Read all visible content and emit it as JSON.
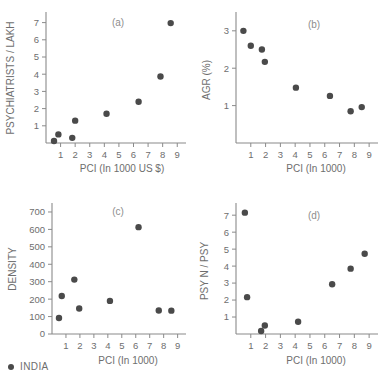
{
  "figure": {
    "marker_color": "#4a4a4a",
    "axis_color": "#8a8a8a",
    "text_color": "#6e6e6e",
    "background": "#ffffff"
  },
  "legend": {
    "label": "INDIA",
    "marker": "filled-circle"
  },
  "chart_data": [
    {
      "type": "scatter",
      "title": "(a)",
      "xlabel": "PCI (In 1000 US $)",
      "ylabel": "PSYCHIATRISTS / LAKH",
      "xlim": [
        0,
        9.6
      ],
      "ylim": [
        0,
        7.5
      ],
      "xticks": [
        1,
        2,
        3,
        4,
        5,
        6,
        7,
        8,
        9
      ],
      "yticks": [
        1,
        2,
        3,
        4,
        5,
        6,
        7
      ],
      "grid": false,
      "series": [
        {
          "name": "INDIA",
          "points": [
            {
              "x": 0.55,
              "y": 0.12
            },
            {
              "x": 0.85,
              "y": 0.5
            },
            {
              "x": 1.8,
              "y": 0.3
            },
            {
              "x": 2.0,
              "y": 1.3
            },
            {
              "x": 4.15,
              "y": 1.7
            },
            {
              "x": 6.35,
              "y": 2.4
            },
            {
              "x": 7.85,
              "y": 3.87
            },
            {
              "x": 8.55,
              "y": 6.97
            }
          ]
        }
      ]
    },
    {
      "type": "scatter",
      "title": "(b)",
      "xlabel": "PCI (In 1000)",
      "ylabel": "AGR (%)",
      "xlim": [
        0,
        9.6
      ],
      "ylim": [
        0,
        3.45
      ],
      "xticks": [
        1,
        2,
        3,
        4,
        5,
        6,
        7,
        8,
        9
      ],
      "yticks": [
        1,
        2,
        3
      ],
      "grid": false,
      "series": [
        {
          "name": "INDIA",
          "points": [
            {
              "x": 0.5,
              "y": 3.0
            },
            {
              "x": 1.0,
              "y": 2.6
            },
            {
              "x": 1.75,
              "y": 2.5
            },
            {
              "x": 1.95,
              "y": 2.17
            },
            {
              "x": 4.05,
              "y": 1.48
            },
            {
              "x": 6.35,
              "y": 1.26
            },
            {
              "x": 7.75,
              "y": 0.85
            },
            {
              "x": 8.5,
              "y": 0.96
            }
          ]
        }
      ]
    },
    {
      "type": "scatter",
      "title": "(c)",
      "xlabel": "PCI (In 1000)",
      "ylabel": "DENSITY",
      "xlim": [
        0,
        9.6
      ],
      "ylim": [
        0,
        740
      ],
      "xticks": [
        1,
        2,
        3,
        4,
        5,
        6,
        7,
        8,
        9
      ],
      "yticks": [
        0,
        100,
        200,
        300,
        400,
        500,
        600,
        700
      ],
      "grid": false,
      "series": [
        {
          "name": "INDIA",
          "points": [
            {
              "x": 0.5,
              "y": 92
            },
            {
              "x": 0.7,
              "y": 218
            },
            {
              "x": 1.6,
              "y": 312
            },
            {
              "x": 1.95,
              "y": 146
            },
            {
              "x": 4.15,
              "y": 190
            },
            {
              "x": 6.2,
              "y": 613
            },
            {
              "x": 7.65,
              "y": 135
            },
            {
              "x": 8.55,
              "y": 134
            }
          ]
        }
      ]
    },
    {
      "type": "scatter",
      "title": "(d)",
      "xlabel": "PCI (In 1000)",
      "ylabel": "PSY N / PSY",
      "xlim": [
        0,
        9.6
      ],
      "ylim": [
        0,
        7.6
      ],
      "xticks": [
        1,
        2,
        3,
        4,
        5,
        6,
        7,
        8,
        9
      ],
      "yticks": [
        1,
        2,
        3,
        4,
        5,
        6,
        7
      ],
      "grid": false,
      "series": [
        {
          "name": "INDIA",
          "points": [
            {
              "x": 0.6,
              "y": 7.15
            },
            {
              "x": 0.75,
              "y": 2.17
            },
            {
              "x": 1.7,
              "y": 0.18
            },
            {
              "x": 1.95,
              "y": 0.5
            },
            {
              "x": 4.2,
              "y": 0.72
            },
            {
              "x": 6.5,
              "y": 2.93
            },
            {
              "x": 7.75,
              "y": 3.85
            },
            {
              "x": 8.7,
              "y": 4.73
            }
          ]
        }
      ]
    }
  ]
}
